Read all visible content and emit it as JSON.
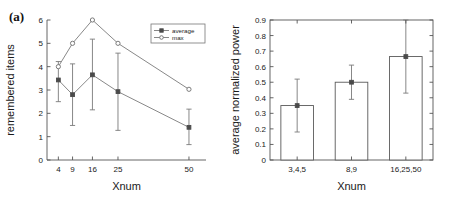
{
  "figure": {
    "width": 452,
    "height": 200,
    "background": "#ffffff",
    "line_color": "#7a7a7a",
    "axis_color": "#555555",
    "text_color": "#1a1a1a"
  },
  "panels": {
    "a": {
      "label": "(a)",
      "chart_data": {
        "type": "line",
        "title": "",
        "xlabel": "Xnum",
        "ylabel": "remembered items",
        "x": [
          4,
          9,
          16,
          25,
          50
        ],
        "xtick_labels": [
          "4",
          "9",
          "16",
          "25",
          "50"
        ],
        "xlim": [
          0,
          56
        ],
        "ylim": [
          0,
          6
        ],
        "ytick_labels": [
          "0",
          "1",
          "2",
          "3",
          "4",
          "5",
          "6"
        ],
        "yticks": [
          0,
          1,
          2,
          3,
          4,
          5,
          6
        ],
        "grid": false,
        "legend_position": "top-right",
        "series": [
          {
            "name": "average",
            "marker": "star-filled",
            "values": [
              3.43,
              2.8,
              3.65,
              2.93,
              1.4
            ],
            "err_low": [
              2.5,
              1.48,
              2.15,
              1.27,
              0.66
            ],
            "err_high": [
              4.22,
              4.12,
              5.18,
              4.58,
              2.18
            ]
          },
          {
            "name": "max",
            "marker": "circle-open",
            "values": [
              4.0,
              5.0,
              6.0,
              5.0,
              3.03
            ],
            "err_low": [
              4.0,
              5.0,
              6.0,
              5.0,
              3.03
            ],
            "err_high": [
              4.0,
              5.0,
              6.0,
              5.0,
              3.03
            ]
          }
        ],
        "legend": [
          "average",
          "max"
        ]
      }
    },
    "b": {
      "label": "(b)",
      "chart_data": {
        "type": "bar",
        "title": "",
        "xlabel": "Xnum",
        "ylabel": "average normalized power",
        "categories": [
          "3,4,5",
          "8,9",
          "16,25,50"
        ],
        "values": [
          0.35,
          0.5,
          0.665
        ],
        "err_low": [
          0.18,
          0.39,
          0.43
        ],
        "err_high": [
          0.52,
          0.61,
          0.9
        ],
        "ylim": [
          0,
          0.9
        ],
        "yticks": [
          0,
          0.1,
          0.2,
          0.3,
          0.4,
          0.5,
          0.6,
          0.7,
          0.8,
          0.9
        ],
        "ytick_labels": [
          "0",
          "0.1",
          "0.2",
          "0.3",
          "0.4",
          "0.5",
          "0.6",
          "0.7",
          "0.8",
          "0.9"
        ],
        "grid": false,
        "legend_position": "none"
      }
    }
  }
}
